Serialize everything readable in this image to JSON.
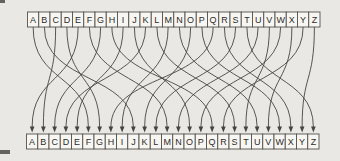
{
  "diagram": {
    "top_row": [
      "A",
      "B",
      "C",
      "D",
      "E",
      "F",
      "G",
      "H",
      "I",
      "J",
      "K",
      "L",
      "M",
      "N",
      "O",
      "P",
      "Q",
      "R",
      "S",
      "T",
      "U",
      "V",
      "W",
      "X",
      "Y",
      "Z"
    ],
    "bottom_row": [
      "A",
      "B",
      "C",
      "D",
      "E",
      "F",
      "G",
      "H",
      "I",
      "J",
      "K",
      "L",
      "M",
      "N",
      "O",
      "P",
      "Q",
      "R",
      "S",
      "T",
      "U",
      "V",
      "W",
      "X",
      "Y",
      "Z"
    ],
    "mapping_top_to_bottom_index": [
      5,
      9,
      1,
      6,
      0,
      12,
      2,
      16,
      4,
      14,
      3,
      18,
      8,
      20,
      10,
      22,
      7,
      23,
      11,
      25,
      13,
      19,
      15,
      21,
      17,
      24
    ],
    "mapping_pairs": [
      "A-F",
      "B-J",
      "C-B",
      "D-G",
      "E-A",
      "F-M",
      "G-C",
      "H-Q",
      "I-E",
      "J-O",
      "K-D",
      "L-S",
      "M-I",
      "N-U",
      "O-K",
      "P-W",
      "Q-H",
      "R-X",
      "S-L",
      "T-Z",
      "U-N",
      "V-T",
      "W-P",
      "X-V",
      "Y-R",
      "Z-Y"
    ]
  },
  "layout_values": {
    "canvas_width": 340,
    "canvas_height": 161,
    "row_left_top": 27.5,
    "row_left_bottom": 26.5,
    "cell_width": 11.25,
    "cell_height": 15,
    "top_row_y": 12,
    "bottom_row_y": 134,
    "curve_start_y": 27,
    "arrow_tip_y": 132.5,
    "arrow_base_y": 126.5,
    "arrow_half_width": 2.3
  },
  "colors": {
    "background": "#e9e8e4",
    "box_fill": "#f7f6f2",
    "box_border": "#54524c",
    "letter": "#2c2b28",
    "curve": "#45443f",
    "edge_artifact": "#4d4b46"
  }
}
